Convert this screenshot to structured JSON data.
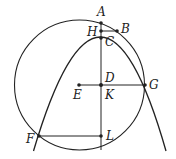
{
  "diagram": {
    "type": "geometry",
    "stroke_color": "#222222",
    "circle": {
      "center": "E",
      "cx": 79.5,
      "cy": 85,
      "r": 65
    },
    "parabola": {
      "vertex": "A",
      "vx": 101,
      "vy": 23,
      "k": 0.0305
    },
    "points": [
      {
        "id": "A",
        "label": "A",
        "x": 101,
        "y": 23
      },
      {
        "id": "B",
        "label": "B",
        "x": 117,
        "y": 31
      },
      {
        "id": "H",
        "label": "H",
        "x": 101,
        "y": 31
      },
      {
        "id": "C",
        "label": "C",
        "x": 101,
        "y": 38
      },
      {
        "id": "D",
        "label": "D",
        "x": 101,
        "y": 85
      },
      {
        "id": "K",
        "label": "K",
        "x": 101,
        "y": 85
      },
      {
        "id": "E",
        "label": "E",
        "x": 79,
        "y": 85
      },
      {
        "id": "G",
        "label": "G",
        "x": 145,
        "y": 85
      },
      {
        "id": "F",
        "label": "F",
        "x": 39,
        "y": 136
      },
      {
        "id": "L",
        "label": "L",
        "x": 101,
        "y": 136
      }
    ],
    "segments": [
      {
        "from": "A",
        "to": "L",
        "note": "vertical axis"
      },
      {
        "from": "H",
        "to": "B"
      },
      {
        "from": "E",
        "to": "G"
      },
      {
        "from": "F",
        "to": "L"
      }
    ],
    "labels": {
      "A": "A",
      "B": "B",
      "H": "H",
      "C": "C",
      "D": "D",
      "K": "K",
      "E": "E",
      "G": "G",
      "F": "F",
      "L": "L"
    }
  }
}
